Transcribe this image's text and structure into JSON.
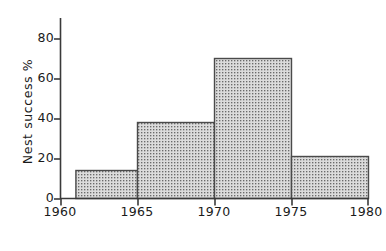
{
  "chart_data": {
    "type": "bar",
    "title": "",
    "subtitle": "",
    "xlabel": "Year",
    "ylabel": "Nest success %",
    "xlim": [
      1960,
      1980
    ],
    "ylim": [
      0,
      80
    ],
    "grid": false,
    "legend": null,
    "xticks": [
      1960,
      1965,
      1970,
      1975,
      1980
    ],
    "xtick_labels": [
      "1960",
      "1965",
      "1970",
      "1975",
      "1980"
    ],
    "yticks": [
      0,
      20,
      40,
      60,
      80
    ],
    "ytick_labels": [
      "0",
      "20",
      "40",
      "60",
      "80"
    ],
    "bar_style": "stippled-fill-dark-outline",
    "bins": [
      {
        "label": "1961-1965",
        "x_start": 1961,
        "x_end": 1965,
        "value": 14
      },
      {
        "label": "1965-1970",
        "x_start": 1965,
        "x_end": 1970,
        "value": 38
      },
      {
        "label": "1970-1975",
        "x_start": 1970,
        "x_end": 1975,
        "value": 70
      },
      {
        "label": "1975-1980",
        "x_start": 1975,
        "x_end": 1980,
        "value": 21
      }
    ],
    "categories": [
      "1961-1965",
      "1965-1970",
      "1970-1975",
      "1975-1980"
    ],
    "values": [
      14,
      38,
      70,
      21
    ],
    "colors": {
      "axis": "#3a3a3a",
      "bar_outline": "#4a4a4a",
      "bar_fill": "#d9d9d9",
      "bar_stipple": "#6e6e6e",
      "background": "#ffffff",
      "text": "#1a1a1a"
    }
  },
  "axis_titles": {
    "y": "Nest success %",
    "x": "Year"
  },
  "ytick_labels": {
    "t0": "0",
    "t1": "20",
    "t2": "40",
    "t3": "60",
    "t4": "80"
  },
  "xtick_labels": {
    "t0": "1960",
    "t1": "1965",
    "t2": "1970",
    "t3": "1975",
    "t4": "1980"
  }
}
